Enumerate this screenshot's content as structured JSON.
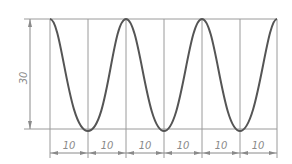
{
  "diagram": {
    "type": "cosine-wave-construction",
    "amplitude_label": "30",
    "segment_labels": [
      "10",
      "10",
      "10",
      "10",
      "10",
      "10"
    ],
    "colors": {
      "curve": "#555555",
      "grid": "#9a9a9a",
      "dimension": "#8a8a8a",
      "background": "#ffffff"
    }
  }
}
